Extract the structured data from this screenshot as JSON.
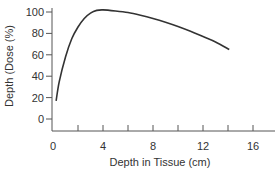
{
  "chart_data": {
    "type": "line",
    "title": "",
    "xlabel": "Depth in Tissue (cm)",
    "ylabel": "Depth (Dose (%)",
    "xlim": [
      0,
      18
    ],
    "ylim": [
      -10,
      100
    ],
    "xticks": [
      0,
      4,
      8,
      12,
      16
    ],
    "xminor_ticks": [
      2,
      6,
      10,
      14
    ],
    "yticks": [
      0,
      20,
      40,
      60,
      80,
      100
    ],
    "grid": false,
    "legend": null,
    "series": [
      {
        "name": "Depth dose curve",
        "color": "#333333",
        "x": [
          0.25,
          0.5,
          1.0,
          1.5,
          2.0,
          2.5,
          3.0,
          3.5,
          4.0,
          5.0,
          6.0,
          7.0,
          8.0,
          9.0,
          10.0,
          11.0,
          12.0,
          13.0,
          14.1
        ],
        "y": [
          17,
          35,
          58,
          75,
          86,
          94,
          99,
          101.5,
          102,
          101,
          99.5,
          97,
          94,
          90.5,
          86.5,
          82,
          77,
          72,
          65
        ]
      }
    ]
  }
}
